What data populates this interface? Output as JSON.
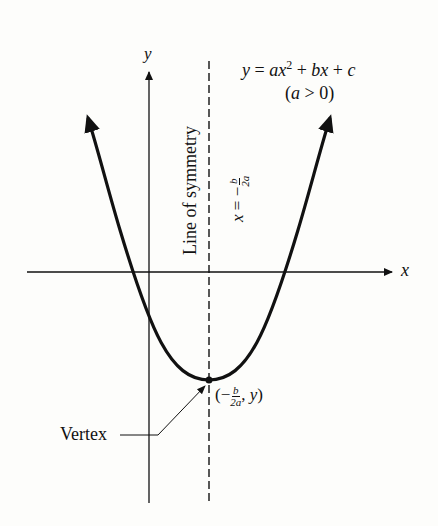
{
  "diagram": {
    "equation": {
      "lhs": "y",
      "rhs_parts": [
        "a",
        "x",
        "2",
        "b",
        "x",
        "c"
      ],
      "text": "y = ax² + bx + c",
      "condition": "(a > 0)"
    },
    "axes": {
      "x_label": "x",
      "y_label": "y"
    },
    "symmetry": {
      "label": "Line of symmetry",
      "equation_text": "x = −b/2a",
      "lhs": "x =",
      "neg": "−",
      "num": "b",
      "den": "2a"
    },
    "vertex": {
      "label": "Vertex",
      "coord_text": "(−b/2a, y)",
      "num": "b",
      "den": "2a",
      "y": "y"
    },
    "colors": {
      "ink": "#111111",
      "background": "#fdfdfb"
    }
  }
}
